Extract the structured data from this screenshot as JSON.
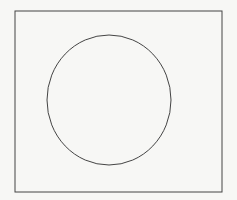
{
  "diagram": {
    "background": "#f7f7f5",
    "stroke": "#444444",
    "frame": {
      "x": 15,
      "y": 11,
      "width": 207,
      "height": 181
    },
    "circle": {
      "cx": 109,
      "cy": 100,
      "rx": 62,
      "ry": 65
    }
  }
}
